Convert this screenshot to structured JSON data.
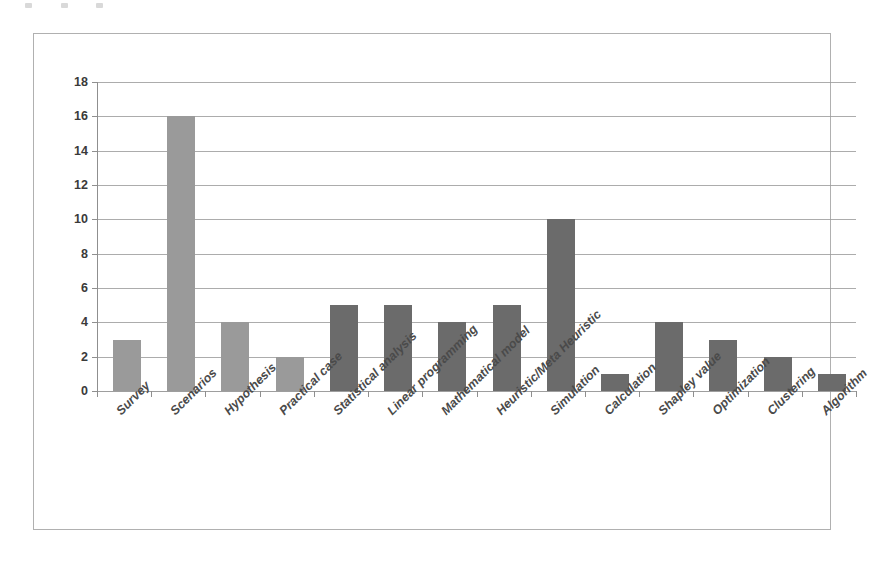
{
  "chart_data": {
    "type": "bar",
    "title": "",
    "subtitle": "",
    "xlabel": "",
    "ylabel": "",
    "ylim": [
      0,
      18
    ],
    "ytick_step": 2,
    "yticks": [
      18,
      16,
      14,
      12,
      10,
      8,
      6,
      4,
      2,
      0
    ],
    "grid": true,
    "legend": false,
    "legend_position": "none",
    "categories": [
      "Survey",
      "Scenarios",
      "Hypothesis",
      "Practical case",
      "Statistical analysis",
      "Linear programming",
      "Mathematical model",
      "Heuristic/Meta Heuristic",
      "Simulation",
      "Calculation",
      "Shapley value",
      "Optimization",
      "Clustering",
      "Algorithm"
    ],
    "values": [
      3,
      16,
      4,
      2,
      5,
      5,
      4,
      5,
      10,
      1,
      4,
      3,
      2,
      1
    ],
    "bar_colors": [
      "#9a9a9a",
      "#9a9a9a",
      "#9a9a9a",
      "#9a9a9a",
      "#6b6b6b",
      "#6b6b6b",
      "#6b6b6b",
      "#6b6b6b",
      "#6b6b6b",
      "#6b6b6b",
      "#6b6b6b",
      "#6b6b6b",
      "#6b6b6b",
      "#6b6b6b"
    ],
    "x_label_rotation_deg": -45
  },
  "colors": {
    "bar_light": "#9a9a9a",
    "bar_dark": "#6b6b6b",
    "gridline": "#9d9d9d",
    "axis": "#8f8f8f",
    "frame": "#b0b0b0",
    "tick_text": "#3a3a3a",
    "category_text": "#4a4a4a",
    "background": "#ffffff"
  }
}
